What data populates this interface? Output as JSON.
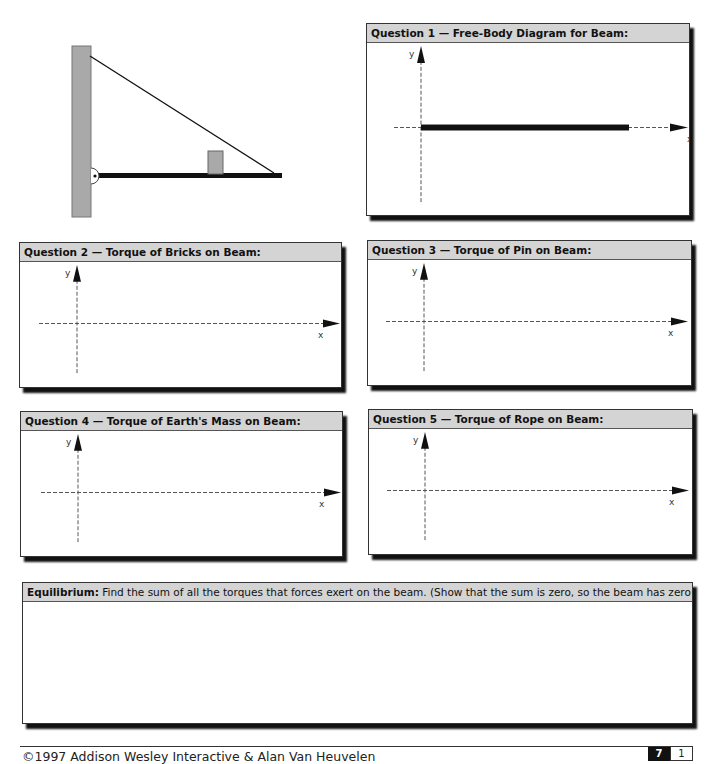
{
  "diagram": {
    "colors": {
      "wall": "#a9a9a9",
      "beam": "#111111",
      "bricks": "#a9a9a9",
      "rope": "#111111"
    }
  },
  "questions": [
    {
      "id": 1,
      "title": "Question 1 — Free-Body Diagram for Beam:",
      "x_label": "x",
      "y_label": "y",
      "shows_beam": true
    },
    {
      "id": 2,
      "title": "Question 2 — Torque of Bricks on Beam:",
      "x_label": "x",
      "y_label": "y",
      "shows_beam": false
    },
    {
      "id": 3,
      "title": "Question 3 — Torque of Pin on Beam:",
      "x_label": "x",
      "y_label": "y",
      "shows_beam": false
    },
    {
      "id": 4,
      "title": "Question 4 — Torque of Earth's Mass on Beam:",
      "x_label": "x",
      "y_label": "y",
      "shows_beam": false
    },
    {
      "id": 5,
      "title": "Question 5 — Torque of Rope on Beam:",
      "x_label": "x",
      "y_label": "y",
      "shows_beam": false
    }
  ],
  "equilibrium": {
    "label": "Equilibrium:",
    "text": " Find the sum of all the torques that forces exert on the beam. (Show that the sum is zero, so the beam has zero acceleration.)"
  },
  "footer": {
    "copyright": "©1997 Addison Wesley Interactive & Alan Van Heuvelen",
    "chapter": "7",
    "page": "1"
  }
}
